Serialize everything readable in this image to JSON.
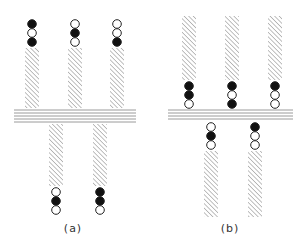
{
  "colors": {
    "line": "#9a9a9a",
    "hatch": "#8c8c8c",
    "filled": "#111111",
    "open": "#ffffff",
    "stroke": "#222222"
  },
  "panels": [
    {
      "id": "a",
      "label": "(a)",
      "label_pos": [
        73,
        222
      ],
      "lines": {
        "x1": 14,
        "x2": 136,
        "y": [
          110,
          113,
          116,
          119,
          122
        ]
      },
      "chains": [
        {
          "x": 32,
          "circles_y": [
            24,
            33,
            42
          ],
          "states": [
            "filled",
            "open",
            "filled"
          ],
          "bar": [
            48,
            108
          ]
        },
        {
          "x": 75,
          "circles_y": [
            24,
            33,
            42
          ],
          "states": [
            "open",
            "filled",
            "open"
          ],
          "bar": [
            48,
            108
          ]
        },
        {
          "x": 117,
          "circles_y": [
            24,
            33,
            42
          ],
          "states": [
            "open",
            "open",
            "filled"
          ],
          "bar": [
            48,
            108
          ]
        },
        {
          "x": 56,
          "circles_y": [
            192,
            201,
            210
          ],
          "states": [
            "open",
            "filled",
            "open"
          ],
          "bar": [
            124,
            186
          ]
        },
        {
          "x": 100,
          "circles_y": [
            192,
            201,
            210
          ],
          "states": [
            "filled",
            "filled",
            "open"
          ],
          "bar": [
            124,
            186
          ]
        }
      ]
    },
    {
      "id": "b",
      "label": "(b)",
      "label_pos": [
        230,
        222
      ],
      "lines": {
        "x1": 168,
        "x2": 293,
        "y": [
          110,
          113,
          116,
          119
        ]
      },
      "chains": [
        {
          "x": 189,
          "circles_y": [
            86,
            95,
            104
          ],
          "states": [
            "filled",
            "filled",
            "open"
          ],
          "bar": [
            16,
            80
          ]
        },
        {
          "x": 232,
          "circles_y": [
            86,
            95,
            104
          ],
          "states": [
            "filled",
            "open",
            "filled"
          ],
          "bar": [
            16,
            80
          ]
        },
        {
          "x": 275,
          "circles_y": [
            86,
            95,
            104
          ],
          "states": [
            "filled",
            "open",
            "open"
          ],
          "bar": [
            16,
            80
          ]
        },
        {
          "x": 211,
          "circles_y": [
            127,
            136,
            145
          ],
          "states": [
            "open",
            "filled",
            "open"
          ],
          "bar": [
            151,
            217
          ]
        },
        {
          "x": 255,
          "circles_y": [
            127,
            136,
            145
          ],
          "states": [
            "filled",
            "open",
            "open"
          ],
          "bar": [
            151,
            217
          ]
        }
      ]
    }
  ]
}
